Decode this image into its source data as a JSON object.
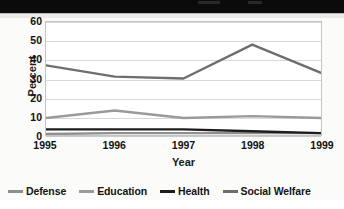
{
  "header": {
    "band_color": "#0b0b0b"
  },
  "chart_data": {
    "type": "line",
    "title": "",
    "xlabel": "Year",
    "ylabel": "Percent",
    "categories": [
      "1995",
      "1996",
      "1997",
      "1998",
      "1999"
    ],
    "x": [
      1995,
      1996,
      1997,
      1998,
      1999
    ],
    "ylim": [
      0,
      60
    ],
    "yticks": [
      0,
      10,
      20,
      30,
      40,
      50,
      60
    ],
    "ytick_labels": [
      "0",
      "10",
      "20",
      "30",
      "40",
      "50",
      "60"
    ],
    "grid": "horizontal",
    "legend_position": "bottom",
    "series": [
      {
        "name": "Defense",
        "color": "#8f8f8f",
        "values": [
          0.5,
          1,
          1,
          1,
          1
        ]
      },
      {
        "name": "Education",
        "color": "#9a9a9a",
        "values": [
          9,
          13,
          9,
          10,
          9
        ]
      },
      {
        "name": "Health",
        "color": "#1d1d1d",
        "values": [
          3,
          3,
          3,
          2,
          1
        ]
      },
      {
        "name": "Social Welfare",
        "color": "#6e6e6e",
        "values": [
          37,
          31,
          30,
          48,
          33
        ]
      }
    ]
  }
}
